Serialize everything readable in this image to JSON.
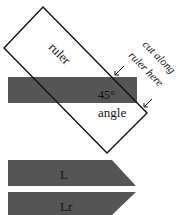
{
  "diagram": {
    "ruler_label": "ruler",
    "angle_value": "45°",
    "angle_label": "angle",
    "instruction_line1": "cut along",
    "instruction_line2": "ruler here",
    "strips": [
      {
        "label": "L"
      },
      {
        "label": "Lr"
      }
    ],
    "colors": {
      "strip_fill": "#555555",
      "outline": "#111111",
      "background": "#ffffff"
    }
  }
}
